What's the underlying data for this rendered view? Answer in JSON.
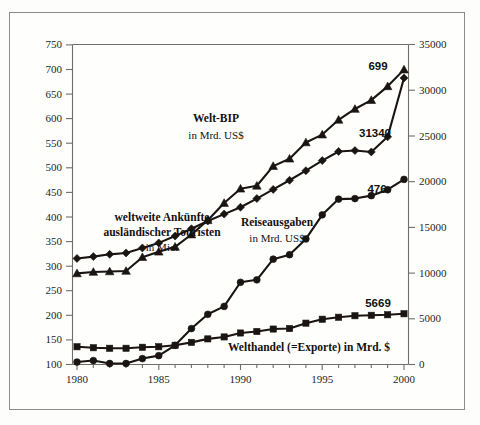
{
  "chart_data": {
    "type": "line",
    "title": "",
    "xlabel": "",
    "ylabel": "",
    "x": [
      1980,
      1981,
      1982,
      1983,
      1984,
      1985,
      1986,
      1987,
      1988,
      1989,
      1990,
      1991,
      1992,
      1993,
      1994,
      1995,
      1996,
      1997,
      1998,
      1999,
      2000
    ],
    "xlim": [
      1979.4,
      2000.6
    ],
    "xticks": [
      1980,
      1985,
      1990,
      1995,
      2000
    ],
    "xticklabels": [
      "1980",
      "1985",
      "1990",
      "1995",
      "2000"
    ],
    "grid": false,
    "legend_position": "inline-annotations",
    "axes": [
      {
        "id": "left",
        "side": "left",
        "lim": [
          100,
          750
        ],
        "ticks": [
          100,
          150,
          200,
          250,
          300,
          350,
          400,
          450,
          500,
          550,
          600,
          650,
          700,
          750
        ],
        "ticklabels": [
          "100",
          "150",
          "200",
          "250",
          "300",
          "350",
          "400",
          "450",
          "500",
          "550",
          "600",
          "650",
          "700",
          "750"
        ]
      },
      {
        "id": "right",
        "side": "right",
        "lim": [
          0,
          35000
        ],
        "ticks": [
          0,
          5000,
          10000,
          15000,
          20000,
          25000,
          30000,
          35000
        ],
        "ticklabels": [
          "0",
          "5000",
          "10000",
          "15000",
          "20000",
          "25000",
          "30000",
          "35000"
        ]
      }
    ],
    "series": [
      {
        "name": "Welt-BIP",
        "label_bold": "Welt-BIP",
        "label_sub": "in Mrd. US$",
        "unit": "Mrd. US$",
        "marker": "diamond",
        "axis": "right",
        "end_value_label": "31340",
        "values": [
          11600,
          11800,
          12050,
          12200,
          12750,
          13300,
          14050,
          14850,
          15700,
          16450,
          17200,
          18150,
          19150,
          20150,
          21200,
          22300,
          23300,
          23400,
          23250,
          24900,
          31340
        ]
      },
      {
        "name": "weltweite Ankünfte auslaendischer Touristen",
        "label_bold": "weltweite Ankünfte\nausländischer Touristen",
        "label_sub": "in Mio.",
        "unit": "Mio.",
        "marker": "triangle",
        "axis": "left",
        "end_value_label": "699",
        "values": [
          285,
          288,
          289,
          290,
          318,
          329,
          339,
          364,
          393,
          428,
          457,
          463,
          503,
          518,
          551,
          567,
          597,
          619,
          637,
          665,
          699
        ]
      },
      {
        "name": "Reiseausgaben",
        "label_bold": "Reiseausgaben",
        "label_sub": "in Mrd. US$",
        "unit": "Mrd. US$",
        "marker": "circle",
        "axis": "left",
        "end_value_label": "476",
        "values": [
          105,
          108,
          102,
          102,
          112,
          118,
          139,
          173,
          202,
          218,
          267,
          272,
          314,
          323,
          355,
          404,
          436,
          437,
          443,
          455,
          476
        ]
      },
      {
        "name": "Welthandel (=Exporte)",
        "label_bold": "Welthandel (=Exporte)",
        "label_sub": "in Mrd. $",
        "label_inline": "Welthandel (=Exporte) in Mrd. $",
        "unit": "Mrd. $",
        "marker": "square",
        "axis": "left",
        "end_value_label": "5669",
        "values": [
          136,
          134,
          133,
          133,
          135,
          136,
          139,
          145,
          152,
          156,
          164,
          167,
          172,
          173,
          184,
          192,
          196,
          199,
          200,
          201,
          203
        ]
      }
    ],
    "annotations": [
      {
        "name": "welt-bip-label",
        "text": "Welt-BIP",
        "sub": "in Mrd. US$"
      },
      {
        "name": "ankuenfte-label",
        "line1": "weltweite Ankünfte",
        "line2": "ausländischer Touristen",
        "sub": "in Mio."
      },
      {
        "name": "reiseausgaben-label",
        "text": "Reiseausgaben",
        "sub": "in Mrd. US$"
      },
      {
        "name": "welthandel-label",
        "text": "Welthandel (=Exporte) in Mrd. $"
      },
      {
        "name": "value-699",
        "text": "699"
      },
      {
        "name": "value-31340",
        "text": "31340"
      },
      {
        "name": "value-476",
        "text": "476"
      },
      {
        "name": "value-5669",
        "text": "5669"
      }
    ]
  },
  "labels": {
    "welt_bip_title": "Welt-BIP",
    "welt_bip_sub": "in Mrd. US$",
    "ankuenfte_line1": "weltweite Ankünfte",
    "ankuenfte_line2": "ausländischer Touristen",
    "ankuenfte_sub": "in Mio.",
    "reise_title": "Reiseausgaben",
    "reise_sub": "in Mrd. US$",
    "welthandel_inline": "Welthandel (=Exporte) in Mrd. $",
    "v_699": "699",
    "v_31340": "31340",
    "v_476": "476",
    "v_5669": "5669"
  },
  "yleft": {
    "t0": "100",
    "t1": "150",
    "t2": "200",
    "t3": "250",
    "t4": "300",
    "t5": "350",
    "t6": "400",
    "t7": "450",
    "t8": "500",
    "t9": "550",
    "t10": "600",
    "t11": "650",
    "t12": "700",
    "t13": "750"
  },
  "yright": {
    "t0": "0",
    "t1": "5000",
    "t2": "10000",
    "t3": "15000",
    "t4": "20000",
    "t5": "25000",
    "t6": "30000",
    "t7": "35000"
  },
  "xaxis": {
    "t0": "1980",
    "t1": "1985",
    "t2": "1990",
    "t3": "1995",
    "t4": "2000"
  },
  "colors": {
    "ink": "#1a1513",
    "axis": "#6e6e6a",
    "frame": "#8c8c88",
    "background": "#fefefd"
  }
}
